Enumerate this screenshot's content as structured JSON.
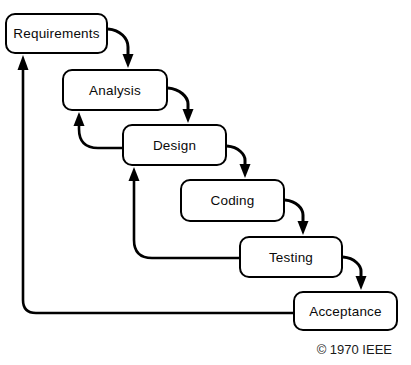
{
  "diagram": {
    "title_semantic": "waterfall-model",
    "stages": [
      {
        "label": "Requirements"
      },
      {
        "label": "Analysis"
      },
      {
        "label": "Design"
      },
      {
        "label": "Coding"
      },
      {
        "label": "Testing"
      },
      {
        "label": "Acceptance"
      }
    ],
    "forward_flows": [
      "Requirements→Analysis",
      "Analysis→Design",
      "Design→Coding",
      "Coding→Testing",
      "Testing→Acceptance"
    ],
    "feedback_flows": [
      "Design→Analysis",
      "Testing→Design",
      "Acceptance→Requirements"
    ],
    "copyright": "© 1970 IEEE",
    "colors": {
      "background": "#ffffff",
      "box_fill": "#ffffff",
      "line": "#000000",
      "text": "#0a0a0a"
    }
  }
}
